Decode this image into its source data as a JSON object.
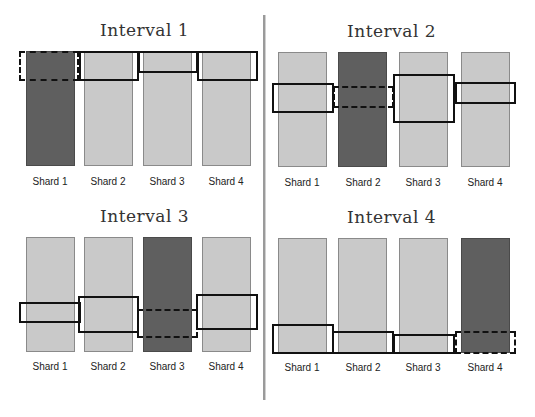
{
  "colors": {
    "active_shard": "#5f5f5f",
    "idle_shard": "#c9c9c9",
    "box": "#111111",
    "divider": "#9a9a9a"
  },
  "panels": [
    {
      "title": "Interval 1",
      "active_shard": 1,
      "labels": [
        "Shard 1",
        "Shard 2",
        "Shard 3",
        "Shard 4"
      ]
    },
    {
      "title": "Interval 2",
      "active_shard": 2,
      "labels": [
        "Shard 1",
        "Shard 2",
        "Shard 3",
        "Shard 4"
      ]
    },
    {
      "title": "Interval 3",
      "active_shard": 3,
      "labels": [
        "Shard 1",
        "Shard 2",
        "Shard 3",
        "Shard 4"
      ]
    },
    {
      "title": "Interval 4",
      "active_shard": 4,
      "labels": [
        "Shard 1",
        "Shard 2",
        "Shard 3",
        "Shard 4"
      ]
    }
  ],
  "legend_semantics": {
    "dark_bar": "active shard in interval",
    "solid_box": "range on idle shard",
    "dashed_box": "range on active shard"
  }
}
